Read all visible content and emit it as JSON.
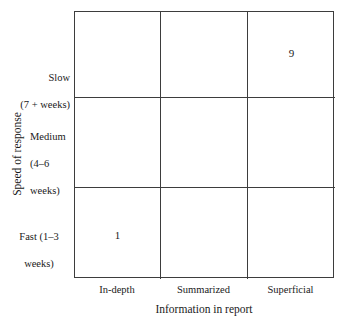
{
  "chart_data": {
    "type": "heatmap",
    "title": "",
    "xlabel": "Information in report",
    "ylabel": "Speed of response",
    "grid": true,
    "legend": "none",
    "x_categories": [
      "In-depth",
      "Summarized",
      "Superficial"
    ],
    "y_categories_top_to_bottom": [
      "Slow\n(7 + weeks)",
      "Medium\n(4–6\nweeks)",
      "Fast (1–3\nweeks)"
    ],
    "y_categories_bottom_to_top": [
      "Fast (1–3 weeks)",
      "Medium (4–6 weeks)",
      "Slow (7 + weeks)"
    ],
    "cells": [
      [
        {
          "row": "Slow (7 + weeks)",
          "col": "In-depth",
          "value": ""
        },
        {
          "row": "Slow (7 + weeks)",
          "col": "Summarized",
          "value": ""
        },
        {
          "row": "Slow (7 + weeks)",
          "col": "Superficial",
          "value": "9"
        }
      ],
      [
        {
          "row": "Medium (4–6 weeks)",
          "col": "In-depth",
          "value": ""
        },
        {
          "row": "Medium (4–6 weeks)",
          "col": "Summarized",
          "value": ""
        },
        {
          "row": "Medium (4–6 weeks)",
          "col": "Superficial",
          "value": ""
        }
      ],
      [
        {
          "row": "Fast (1–3 weeks)",
          "col": "In-depth",
          "value": "1"
        },
        {
          "row": "Fast (1–3 weeks)",
          "col": "Summarized",
          "value": ""
        },
        {
          "row": "Fast (1–3 weeks)",
          "col": "Superficial",
          "value": ""
        }
      ]
    ],
    "data_points": [
      {
        "x": "Superficial",
        "y": "Slow (7 + weeks)",
        "label": "9"
      },
      {
        "x": "In-depth",
        "y": "Fast (1–3 weeks)",
        "label": "1"
      }
    ],
    "colors": {
      "line": "#3d3d3d",
      "background": "#ffffff",
      "text": "#1a1a1a"
    }
  },
  "axes": {
    "x": {
      "title": "Information in report",
      "ticks": [
        "In-depth",
        "Summarized",
        "Superficial"
      ]
    },
    "y": {
      "title": "Speed of response",
      "tick_slow_line1": "Slow",
      "tick_slow_line2": "(7 + weeks)",
      "tick_medium_line1": "Medium",
      "tick_medium_line2": "(4–6",
      "tick_medium_line3": "weeks)",
      "tick_fast_line1": "Fast (1–3",
      "tick_fast_line2": "weeks)"
    }
  },
  "values": {
    "top_right": "9",
    "bottom_left": "1"
  }
}
